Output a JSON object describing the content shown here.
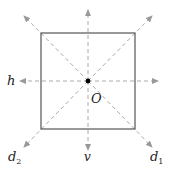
{
  "diagram": {
    "center_label": "O",
    "axes": [
      {
        "id": "h",
        "label": "h",
        "direction": "horizontal"
      },
      {
        "id": "v",
        "label": "v",
        "direction": "vertical"
      },
      {
        "id": "d1",
        "label": "d",
        "subscript": "1",
        "direction": "diagonal top-left to bottom-right"
      },
      {
        "id": "d2",
        "label": "d",
        "subscript": "2",
        "direction": "diagonal top-right to bottom-left"
      }
    ],
    "colors": {
      "square": "#555555",
      "axes": "#aaaaaa",
      "center": "#000000"
    }
  }
}
